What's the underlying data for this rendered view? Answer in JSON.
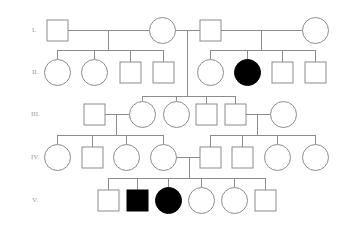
{
  "diagram": {
    "type": "pedigree",
    "colors": {
      "line": "#8c8c8c",
      "affected_fill": "#000000",
      "unaffected_fill": "#ffffff",
      "label": "#9a9a9a"
    },
    "generations": [
      {
        "label": "I.",
        "y": 30
      },
      {
        "label": "II.",
        "y": 72
      },
      {
        "label": "III.",
        "y": 114
      },
      {
        "label": "IV.",
        "y": 157
      },
      {
        "label": "V.",
        "y": 200
      }
    ],
    "individuals": [
      {
        "id": "I-1",
        "sex": "male",
        "affected": false,
        "x": 57,
        "y": 30
      },
      {
        "id": "I-2",
        "sex": "female",
        "affected": false,
        "x": 162,
        "y": 30
      },
      {
        "id": "I-3",
        "sex": "male",
        "affected": false,
        "x": 210,
        "y": 30
      },
      {
        "id": "I-4",
        "sex": "female",
        "affected": false,
        "x": 315,
        "y": 30
      },
      {
        "id": "II-1",
        "sex": "female",
        "affected": false,
        "x": 57,
        "y": 72
      },
      {
        "id": "II-2",
        "sex": "female",
        "affected": false,
        "x": 94,
        "y": 72
      },
      {
        "id": "II-3",
        "sex": "male",
        "affected": false,
        "x": 130,
        "y": 72
      },
      {
        "id": "II-4",
        "sex": "male",
        "affected": false,
        "x": 163,
        "y": 72
      },
      {
        "id": "II-5",
        "sex": "female",
        "affected": false,
        "x": 210,
        "y": 72
      },
      {
        "id": "II-6",
        "sex": "female",
        "affected": true,
        "x": 247,
        "y": 72
      },
      {
        "id": "II-7",
        "sex": "male",
        "affected": false,
        "x": 282,
        "y": 72
      },
      {
        "id": "II-8",
        "sex": "male",
        "affected": false,
        "x": 315,
        "y": 72
      },
      {
        "id": "III-1",
        "sex": "male",
        "affected": false,
        "x": 94,
        "y": 114
      },
      {
        "id": "III-2",
        "sex": "female",
        "affected": false,
        "x": 142,
        "y": 114
      },
      {
        "id": "III-3",
        "sex": "female",
        "affected": false,
        "x": 176,
        "y": 114
      },
      {
        "id": "III-4",
        "sex": "male",
        "affected": false,
        "x": 206,
        "y": 114
      },
      {
        "id": "III-5",
        "sex": "male",
        "affected": false,
        "x": 235,
        "y": 114
      },
      {
        "id": "III-6",
        "sex": "female",
        "affected": false,
        "x": 283,
        "y": 114
      },
      {
        "id": "IV-1",
        "sex": "female",
        "affected": false,
        "x": 57,
        "y": 157
      },
      {
        "id": "IV-2",
        "sex": "male",
        "affected": false,
        "x": 92,
        "y": 157
      },
      {
        "id": "IV-3",
        "sex": "female",
        "affected": false,
        "x": 126,
        "y": 157
      },
      {
        "id": "IV-4",
        "sex": "female",
        "affected": false,
        "x": 163,
        "y": 157
      },
      {
        "id": "IV-5",
        "sex": "male",
        "affected": false,
        "x": 210,
        "y": 157
      },
      {
        "id": "IV-6",
        "sex": "male",
        "affected": false,
        "x": 242,
        "y": 157
      },
      {
        "id": "IV-7",
        "sex": "female",
        "affected": false,
        "x": 277,
        "y": 157
      },
      {
        "id": "IV-8",
        "sex": "female",
        "affected": false,
        "x": 315,
        "y": 157
      },
      {
        "id": "V-1",
        "sex": "male",
        "affected": false,
        "x": 108,
        "y": 200
      },
      {
        "id": "V-2",
        "sex": "male",
        "affected": true,
        "x": 137,
        "y": 200
      },
      {
        "id": "V-3",
        "sex": "female",
        "affected": true,
        "x": 168,
        "y": 200
      },
      {
        "id": "V-4",
        "sex": "female",
        "affected": false,
        "x": 201,
        "y": 200
      },
      {
        "id": "V-5",
        "sex": "female",
        "affected": false,
        "x": 234,
        "y": 200
      },
      {
        "id": "V-6",
        "sex": "male",
        "affected": false,
        "x": 265,
        "y": 200
      }
    ],
    "matings": [
      {
        "parents": [
          "I-1",
          "I-2"
        ],
        "children": [
          "II-1",
          "II-2",
          "II-3",
          "II-4"
        ]
      },
      {
        "parents": [
          "I-2",
          "I-3"
        ],
        "children": [
          "III-2",
          "III-3",
          "III-4",
          "III-5"
        ]
      },
      {
        "parents": [
          "I-3",
          "I-4"
        ],
        "children": [
          "II-5",
          "II-6",
          "II-7",
          "II-8"
        ]
      },
      {
        "parents": [
          "III-1",
          "III-2"
        ],
        "children": [
          "IV-1",
          "IV-2",
          "IV-3",
          "IV-4"
        ]
      },
      {
        "parents": [
          "III-5",
          "III-6"
        ],
        "children": [
          "IV-5",
          "IV-6",
          "IV-7",
          "IV-8"
        ]
      },
      {
        "parents": [
          "IV-4",
          "IV-5"
        ],
        "children": [
          "V-1",
          "V-2",
          "V-3",
          "V-4",
          "V-5",
          "V-6"
        ]
      }
    ]
  }
}
